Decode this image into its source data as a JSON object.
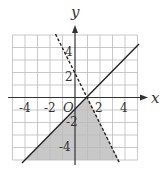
{
  "diagram": {
    "axis_labels": {
      "x": "x",
      "y": "y",
      "origin": "O"
    },
    "x_ticks": [
      "-4",
      "-2",
      "2",
      "4"
    ],
    "y_ticks": [
      "4",
      "2",
      "-2",
      "-4"
    ],
    "grid_range": {
      "x": [
        -5,
        5
      ],
      "y": [
        -5,
        5
      ]
    },
    "lines": [
      {
        "name": "solid",
        "equation": "y = x - 1",
        "style": "solid"
      },
      {
        "name": "dashed",
        "equation": "y = -2x + 2",
        "style": "dashed"
      }
    ],
    "shaded_region": "y <= x - 1 and y < -2x + 2",
    "colors": {
      "shade": "#c8c8c8",
      "grid": "#bbbbbb",
      "line": "#222222"
    }
  }
}
